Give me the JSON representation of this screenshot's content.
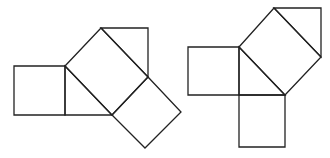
{
  "diagram": {
    "stroke_color": "#222222",
    "background": "#ffffff",
    "figures": [
      {
        "id": "left-figure",
        "shapes": [
          {
            "name": "left-square",
            "type": "polygon",
            "points": [
              [
                14,
                66
              ],
              [
                65,
                66
              ],
              [
                65,
                115
              ],
              [
                14,
                115
              ]
            ]
          },
          {
            "name": "central-triangle",
            "type": "polygon",
            "points": [
              [
                65,
                66
              ],
              [
                112,
                115
              ],
              [
                65,
                115
              ]
            ]
          },
          {
            "name": "rotated-square",
            "type": "polygon",
            "points": [
              [
                65,
                66
              ],
              [
                101,
                28
              ],
              [
                148,
                77
              ],
              [
                112,
                115
              ]
            ]
          },
          {
            "name": "top-triangle",
            "type": "polygon",
            "points": [
              [
                101,
                28
              ],
              [
                148,
                28
              ],
              [
                148,
                77
              ]
            ]
          },
          {
            "name": "bottom-right-square",
            "type": "polygon",
            "points": [
              [
                112,
                115
              ],
              [
                148,
                77
              ],
              [
                181,
                112
              ],
              [
                145,
                148
              ]
            ]
          }
        ]
      },
      {
        "id": "right-figure",
        "shapes": [
          {
            "name": "left-square",
            "type": "polygon",
            "points": [
              [
                188,
                47
              ],
              [
                239,
                47
              ],
              [
                239,
                95
              ],
              [
                188,
                95
              ]
            ]
          },
          {
            "name": "central-triangle",
            "type": "polygon",
            "points": [
              [
                239,
                47
              ],
              [
                285,
                95
              ],
              [
                239,
                95
              ]
            ]
          },
          {
            "name": "rotated-square",
            "type": "polygon",
            "points": [
              [
                239,
                47
              ],
              [
                274,
                8
              ],
              [
                321,
                57
              ],
              [
                285,
                95
              ]
            ]
          },
          {
            "name": "top-triangle",
            "type": "polygon",
            "points": [
              [
                274,
                8
              ],
              [
                321,
                8
              ],
              [
                321,
                57
              ]
            ]
          },
          {
            "name": "bottom-square",
            "type": "polygon",
            "points": [
              [
                239,
                95
              ],
              [
                285,
                95
              ],
              [
                285,
                147
              ],
              [
                239,
                147
              ]
            ]
          }
        ]
      }
    ]
  }
}
